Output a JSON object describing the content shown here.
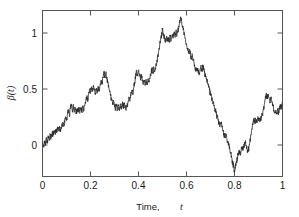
{
  "chart_data": {
    "type": "line",
    "title": "",
    "subtitle": "",
    "xlabel_prefix": "Time,",
    "xlabel_symbol": "t",
    "ylabel_symbol": "β",
    "ylabel_arg": "(t)",
    "ylabel_full": "β(t)",
    "xlim": [
      0,
      1
    ],
    "ylim": [
      -0.25,
      1.25
    ],
    "xticks": [
      0,
      0.2,
      0.4,
      0.6,
      0.8,
      1
    ],
    "xticklabels": [
      "0",
      "0.2",
      "0.4",
      "0.6",
      "0.8",
      "1"
    ],
    "yticks": [
      0,
      0.5,
      1
    ],
    "yticklabels": [
      "0",
      "0.5",
      "1"
    ],
    "grid": false,
    "legend": null,
    "series": [
      {
        "name": "beta(t)",
        "color": "#2b2b2b",
        "description": "Simulated standard Brownian motion sample path on [0,1]",
        "x": [
          0.0,
          0.004,
          0.008,
          0.012,
          0.016,
          0.02,
          0.024,
          0.028,
          0.032,
          0.036,
          0.04,
          0.044,
          0.048,
          0.052,
          0.056,
          0.06,
          0.064,
          0.068,
          0.072,
          0.076,
          0.08,
          0.084,
          0.088,
          0.092,
          0.096,
          0.1,
          0.104,
          0.108,
          0.112,
          0.116,
          0.12,
          0.124,
          0.128,
          0.132,
          0.136,
          0.14,
          0.144,
          0.148,
          0.152,
          0.156,
          0.16,
          0.164,
          0.168,
          0.172,
          0.176,
          0.18,
          0.184,
          0.188,
          0.192,
          0.196,
          0.2,
          0.204,
          0.208,
          0.212,
          0.216,
          0.22,
          0.224,
          0.228,
          0.232,
          0.236,
          0.24,
          0.244,
          0.248,
          0.252,
          0.256,
          0.26,
          0.264,
          0.268,
          0.272,
          0.276,
          0.28,
          0.284,
          0.288,
          0.292,
          0.296,
          0.3,
          0.304,
          0.308,
          0.312,
          0.316,
          0.32,
          0.324,
          0.328,
          0.332,
          0.336,
          0.34,
          0.344,
          0.348,
          0.352,
          0.356,
          0.36,
          0.364,
          0.368,
          0.372,
          0.376,
          0.38,
          0.384,
          0.388,
          0.392,
          0.396,
          0.4,
          0.404,
          0.408,
          0.412,
          0.416,
          0.42,
          0.424,
          0.428,
          0.432,
          0.436,
          0.44,
          0.444,
          0.448,
          0.452,
          0.456,
          0.46,
          0.464,
          0.468,
          0.472,
          0.476,
          0.48,
          0.484,
          0.488,
          0.492,
          0.496,
          0.5,
          0.504,
          0.508,
          0.512,
          0.516,
          0.52,
          0.524,
          0.528,
          0.532,
          0.536,
          0.54,
          0.544,
          0.548,
          0.552,
          0.556,
          0.56,
          0.564,
          0.568,
          0.572,
          0.576,
          0.58,
          0.584,
          0.588,
          0.592,
          0.596,
          0.6,
          0.604,
          0.608,
          0.612,
          0.616,
          0.62,
          0.624,
          0.628,
          0.632,
          0.636,
          0.64,
          0.644,
          0.648,
          0.652,
          0.656,
          0.66,
          0.664,
          0.668,
          0.672,
          0.676,
          0.68,
          0.684,
          0.688,
          0.692,
          0.696,
          0.7,
          0.704,
          0.708,
          0.712,
          0.716,
          0.72,
          0.724,
          0.728,
          0.732,
          0.736,
          0.74,
          0.744,
          0.748,
          0.752,
          0.756,
          0.76,
          0.764,
          0.768,
          0.772,
          0.776,
          0.78,
          0.784,
          0.788,
          0.792,
          0.796,
          0.8,
          0.804,
          0.808,
          0.812,
          0.816,
          0.82,
          0.824,
          0.828,
          0.832,
          0.836,
          0.84,
          0.844,
          0.848,
          0.852,
          0.856,
          0.86,
          0.864,
          0.868,
          0.872,
          0.876,
          0.88,
          0.884,
          0.888,
          0.892,
          0.896,
          0.9,
          0.904,
          0.908,
          0.912,
          0.916,
          0.92,
          0.924,
          0.928,
          0.932,
          0.936,
          0.94,
          0.944,
          0.948,
          0.952,
          0.956,
          0.96,
          0.964,
          0.968,
          0.972,
          0.976,
          0.98,
          0.984,
          0.988,
          0.992,
          0.996,
          1.0
        ],
        "y": [
          0.06,
          0.02,
          0.07,
          0.03,
          0.09,
          0.05,
          0.11,
          0.075,
          0.13,
          0.1,
          0.15,
          0.12,
          0.165,
          0.14,
          0.175,
          0.15,
          0.185,
          0.16,
          0.19,
          0.17,
          0.2,
          0.23,
          0.205,
          0.25,
          0.29,
          0.255,
          0.31,
          0.35,
          0.3,
          0.36,
          0.4,
          0.345,
          0.39,
          0.33,
          0.375,
          0.32,
          0.36,
          0.33,
          0.37,
          0.335,
          0.375,
          0.34,
          0.38,
          0.345,
          0.39,
          0.42,
          0.47,
          0.43,
          0.49,
          0.54,
          0.5,
          0.56,
          0.52,
          0.575,
          0.53,
          0.5,
          0.545,
          0.505,
          0.555,
          0.52,
          0.57,
          0.62,
          0.58,
          0.64,
          0.7,
          0.65,
          0.69,
          0.64,
          0.6,
          0.56,
          0.52,
          0.48,
          0.44,
          0.4,
          0.44,
          0.4,
          0.36,
          0.395,
          0.355,
          0.39,
          0.36,
          0.4,
          0.37,
          0.41,
          0.375,
          0.415,
          0.38,
          0.35,
          0.385,
          0.42,
          0.47,
          0.43,
          0.48,
          0.53,
          0.49,
          0.55,
          0.6,
          0.65,
          0.7,
          0.66,
          0.71,
          0.67,
          0.63,
          0.66,
          0.62,
          0.58,
          0.62,
          0.585,
          0.625,
          0.59,
          0.63,
          0.6,
          0.64,
          0.68,
          0.72,
          0.69,
          0.73,
          0.7,
          0.74,
          0.78,
          0.83,
          0.88,
          0.93,
          0.98,
          1.03,
          1.08,
          1.04,
          1.0,
          0.96,
          1.01,
          0.97,
          1.01,
          0.97,
          1.02,
          0.98,
          1.03,
          1.0,
          1.05,
          1.02,
          1.06,
          1.03,
          1.07,
          1.11,
          1.15,
          1.18,
          1.15,
          1.11,
          1.07,
          1.03,
          0.99,
          0.95,
          0.91,
          0.87,
          0.9,
          0.86,
          0.82,
          0.85,
          0.81,
          0.77,
          0.73,
          0.7,
          0.73,
          0.7,
          0.67,
          0.7,
          0.74,
          0.71,
          0.745,
          0.71,
          0.68,
          0.65,
          0.62,
          0.59,
          0.56,
          0.53,
          0.5,
          0.47,
          0.44,
          0.41,
          0.38,
          0.35,
          0.32,
          0.29,
          0.26,
          0.23,
          0.2,
          0.23,
          0.195,
          0.165,
          0.13,
          0.1,
          0.13,
          0.095,
          0.065,
          0.03,
          0.0,
          -0.04,
          -0.08,
          -0.12,
          -0.16,
          -0.195,
          -0.16,
          -0.12,
          -0.08,
          -0.045,
          -0.01,
          -0.045,
          -0.01,
          0.02,
          0.0,
          0.03,
          0.06,
          0.03,
          0.0,
          -0.03,
          0.01,
          0.06,
          0.12,
          0.18,
          0.23,
          0.26,
          0.24,
          0.27,
          0.245,
          0.275,
          0.25,
          0.28,
          0.255,
          0.285,
          0.31,
          0.35,
          0.4,
          0.45,
          0.49,
          0.455,
          0.495,
          0.46,
          0.42,
          0.455,
          0.42,
          0.385,
          0.35,
          0.32,
          0.35,
          0.32,
          0.35,
          0.325,
          0.36,
          0.395,
          0.37,
          0.42
        ]
      }
    ]
  },
  "axes": {
    "x_tick_labels": [
      "0",
      "0.2",
      "0.4",
      "0.6",
      "0.8",
      "1"
    ],
    "y_tick_labels": [
      "0",
      "0.5",
      "1"
    ],
    "x_axis_title": "Time, t",
    "y_axis_title": "β(t)"
  }
}
